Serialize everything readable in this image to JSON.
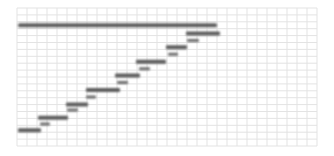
{
  "chart_data": {
    "type": "gantt",
    "title": "",
    "xlabel": "",
    "ylabel": "",
    "grid": true,
    "legend": "none",
    "x_range": [
      0,
      30
    ],
    "row_count": 20,
    "colors": {
      "bar": "#5b5b5b",
      "grid": "#e3e3e3",
      "background": "#ffffff"
    },
    "summary": {
      "name": "Summary",
      "start": 0.1,
      "end": 20.0,
      "row": 2.5
    },
    "tasks": [
      {
        "name": "Task 1",
        "start": 0.1,
        "end": 2.4,
        "row": 17.7
      },
      {
        "name": "Task 2",
        "start": 2.1,
        "end": 5.1,
        "row": 15.9
      },
      {
        "name": "Task 3",
        "start": 4.9,
        "end": 7.1,
        "row": 14.0
      },
      {
        "name": "Task 4",
        "start": 6.9,
        "end": 10.3,
        "row": 11.9
      },
      {
        "name": "Task 5",
        "start": 9.8,
        "end": 12.3,
        "row": 9.8
      },
      {
        "name": "Task 6",
        "start": 11.9,
        "end": 14.9,
        "row": 7.8
      },
      {
        "name": "Task 7",
        "start": 14.9,
        "end": 17.0,
        "row": 5.7
      },
      {
        "name": "Task 8",
        "start": 16.9,
        "end": 20.3,
        "row": 3.7
      }
    ],
    "links": [
      {
        "start": 2.3,
        "end": 3.3,
        "row": 16.8
      },
      {
        "start": 5.0,
        "end": 6.1,
        "row": 14.8
      },
      {
        "start": 6.9,
        "end": 7.9,
        "row": 12.9
      },
      {
        "start": 10.0,
        "end": 11.1,
        "row": 10.8
      },
      {
        "start": 12.2,
        "end": 13.3,
        "row": 8.8
      },
      {
        "start": 15.1,
        "end": 16.1,
        "row": 6.7
      },
      {
        "start": 17.0,
        "end": 18.2,
        "row": 4.7
      }
    ]
  }
}
